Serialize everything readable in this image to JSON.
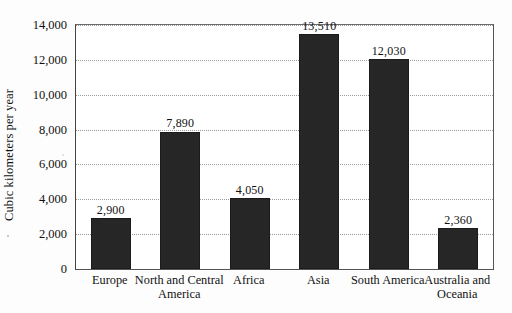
{
  "chart_data": {
    "type": "bar",
    "title": "",
    "subtitle": "",
    "xlabel": "",
    "ylabel": "Cubic kilometers per year",
    "categories": [
      "Europe",
      "North and Central America",
      "Africa",
      "Asia",
      "South America",
      "Australia and Oceania"
    ],
    "category_lines": [
      [
        "Europe",
        ""
      ],
      [
        "North and Central",
        "America"
      ],
      [
        "Africa",
        ""
      ],
      [
        "Asia",
        ""
      ],
      [
        "South America",
        ""
      ],
      [
        "Australia and",
        "Oceania"
      ]
    ],
    "values": [
      2900,
      7890,
      4050,
      13510,
      12030,
      2360
    ],
    "data_labels": [
      "2,900",
      "7,890",
      "4,050",
      "13,510",
      "12,030",
      "2,360"
    ],
    "ylim": [
      0,
      14000
    ],
    "ytick_values": [
      0,
      2000,
      4000,
      6000,
      8000,
      10000,
      12000,
      14000
    ],
    "ytick_labels": [
      "0",
      "2,000",
      "4,000",
      "6,000",
      "8,000",
      "10,000",
      "12,000",
      "14,000"
    ],
    "grid": true,
    "grid_style": "dotted-horizontal",
    "legend": null,
    "bar_color": "#262626",
    "plot_background": "#ffffff",
    "grid_color": "#9a9a9a",
    "axis_color": "#555555"
  },
  "figure": {
    "caption_cropped": ""
  }
}
